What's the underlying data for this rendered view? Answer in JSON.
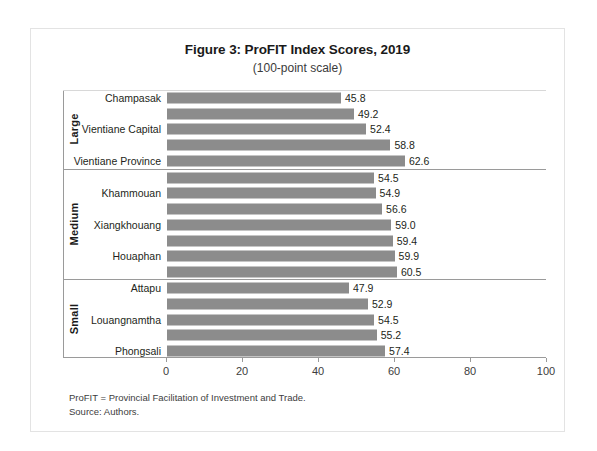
{
  "chart_data": {
    "type": "bar",
    "orientation": "horizontal",
    "title": "Figure 3: ProFIT Index Scores, 2019",
    "subtitle": "(100-point scale)",
    "xlabel": "",
    "ylabel": "",
    "xlim": [
      0,
      100
    ],
    "xticks": [
      0,
      20,
      40,
      60,
      80,
      100
    ],
    "grid": false,
    "legend": null,
    "bar_color": "#8c8c8c",
    "groups": [
      {
        "name": "Large",
        "categories": [
          "Champasak",
          "",
          "Vientiane Capital",
          "",
          "Vientiane Province"
        ],
        "values": [
          45.8,
          49.2,
          52.4,
          58.8,
          62.6
        ],
        "labels": [
          "45.8",
          "49.2",
          "52.4",
          "58.8",
          "62.6"
        ]
      },
      {
        "name": "Medium",
        "categories": [
          "",
          "Khammouan",
          "",
          "Xiangkhouang",
          "",
          "Houaphan",
          ""
        ],
        "values": [
          54.5,
          54.9,
          56.6,
          59.0,
          59.4,
          59.9,
          60.5
        ],
        "labels": [
          "54.5",
          "54.9",
          "56.6",
          "59.0",
          "59.4",
          "59.9",
          "60.5"
        ]
      },
      {
        "name": "Small",
        "categories": [
          "Attapu",
          "",
          "Louangnamtha",
          "",
          "Phongsali"
        ],
        "values": [
          47.9,
          52.9,
          54.5,
          55.2,
          57.4
        ],
        "labels": [
          "47.9",
          "52.9",
          "54.5",
          "55.2",
          "57.4"
        ]
      }
    ],
    "categories": [
      "Champasak",
      "",
      "Vientiane Capital",
      "",
      "Vientiane Province",
      "",
      "Khammouan",
      "",
      "Xiangkhouang",
      "",
      "Houaphan",
      "",
      "Attapu",
      "",
      "Louangnamtha",
      "",
      "Phongsali"
    ],
    "values": [
      45.8,
      49.2,
      52.4,
      58.8,
      62.6,
      54.5,
      54.9,
      56.6,
      59.0,
      59.4,
      59.9,
      60.5,
      47.9,
      52.9,
      54.5,
      55.2,
      57.4
    ]
  },
  "notes": {
    "line1": "ProFIT = Provincial Facilitation of Investment and Trade.",
    "line2": "Source: Authors."
  }
}
